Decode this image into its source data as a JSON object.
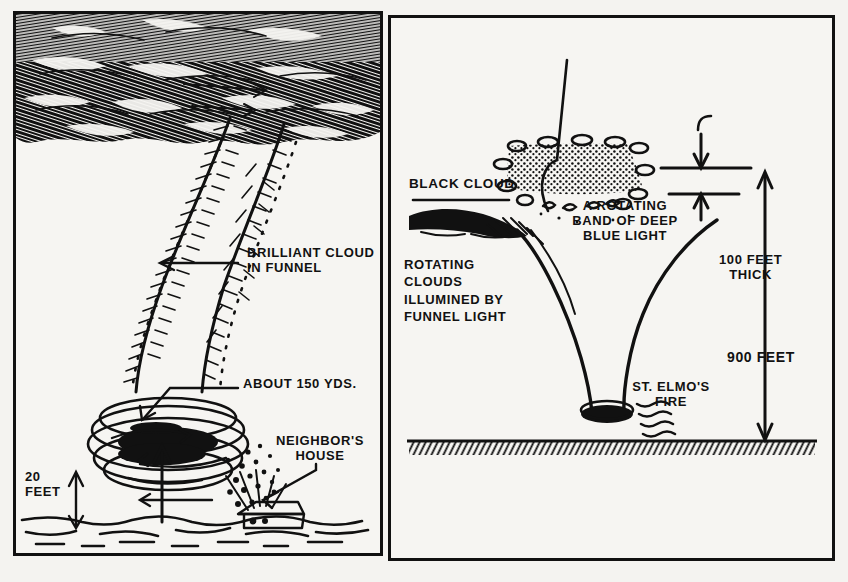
{
  "figure": {
    "title_alt": "Tornado funnel illustration, two panels",
    "ink_color": "#111111",
    "paper_color": "#f4f3f0"
  },
  "left_panel": {
    "name": "eyewitness-view-of-tornado",
    "labels": [
      {
        "id": "brilliant-cloud",
        "text": "BRILLIANT CLOUD\nIN FUNNEL",
        "x": 244,
        "y": 242,
        "size": 13,
        "align": "left"
      },
      {
        "id": "about-150-yds",
        "text": "ABOUT 150 YDS.",
        "x": 240,
        "y": 373,
        "size": 13,
        "align": "left"
      },
      {
        "id": "neighbors-house",
        "text": "NEIGHBOR'S\nHOUSE",
        "x": 308,
        "y": 430,
        "size": 13,
        "align": "center"
      },
      {
        "id": "twenty-feet",
        "text": "20\nFEET",
        "x": 22,
        "y": 466,
        "size": 13,
        "align": "left"
      }
    ]
  },
  "right_panel": {
    "name": "schematic-cross-section-of-funnel",
    "labels": [
      {
        "id": "black-cloud",
        "text": "BLACK CLOUD",
        "x": 410,
        "y": 179,
        "size": 13,
        "align": "left"
      },
      {
        "id": "rotating-band",
        "text": "A ROTATING\nBAND OF DEEP\nBLUE LIGHT",
        "x": 628,
        "y": 200,
        "size": 13,
        "align": "center"
      },
      {
        "id": "rotating-clouds",
        "text": "ROTATING\nCLOUDS\nILLUMINED BY\nFUNNEL LIGHT",
        "x": 405,
        "y": 258,
        "size": 13,
        "align": "left"
      },
      {
        "id": "hundred-feet-thick",
        "text": "100 FEET\nTHICK",
        "x": 723,
        "y": 254,
        "size": 13,
        "align": "left"
      },
      {
        "id": "nine-hundred-feet",
        "text": "900 FEET",
        "x": 729,
        "y": 351,
        "size": 14,
        "align": "left"
      },
      {
        "id": "st-elmos-fire",
        "text": "ST. ELMO'S\nFIRE",
        "x": 626,
        "y": 381,
        "size": 13,
        "align": "left"
      }
    ],
    "measurements": [
      {
        "id": "band-thickness",
        "value": "100 FEET",
        "qualifier": "THICK"
      },
      {
        "id": "funnel-height",
        "value": "900 FEET",
        "qualifier": ""
      }
    ]
  },
  "left_panel_measurements": [
    {
      "id": "funnel-width",
      "value": "ABOUT 150 YDS."
    },
    {
      "id": "ground-clearance",
      "value": "20 FEET"
    }
  ]
}
